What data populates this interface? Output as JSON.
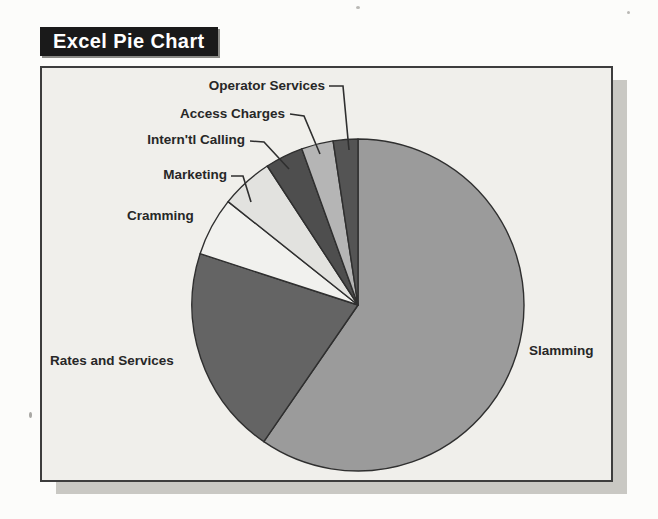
{
  "header": {
    "title": "Excel Pie Chart"
  },
  "colors": {
    "banner_bg": "#1a1a1a",
    "banner_text": "#ffffff",
    "chart_bg": "#f0efeb",
    "frame_border": "#3d3d3d",
    "shadow": "#c9c8c3",
    "label_text": "#272727",
    "slice_stroke": "#2f2f2f"
  },
  "chart_data": {
    "type": "pie",
    "title": "Excel Pie Chart",
    "unit": "percent_share",
    "start_angle_deg": 0,
    "direction": "clockwise",
    "legend": "none",
    "labeling": "category-callout-labels",
    "categories": [
      "Slamming",
      "Rates and Services",
      "Cramming",
      "Marketing",
      "Intern'tl Calling",
      "Access Charges",
      "Operator Services"
    ],
    "values": [
      59.6,
      20.4,
      5.7,
      5.1,
      3.7,
      3.1,
      2.4
    ],
    "slice_colors": [
      "#9b9b9b",
      "#646464",
      "#f1f1ee",
      "#e2e2df",
      "#4e4e4e",
      "#b5b5b5",
      "#545454"
    ]
  }
}
